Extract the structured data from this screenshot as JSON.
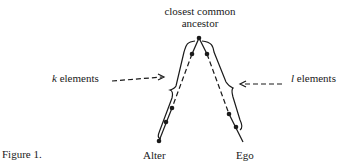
{
  "figure": {
    "caption": "Figure 1.",
    "top_label_line1": "closest common",
    "top_label_line2": "ancestor",
    "left_label_var": "k",
    "left_label_text": " elements",
    "right_label_var": "l",
    "right_label_text": " elements",
    "bottom_left": "Alter",
    "bottom_right": "Ego"
  },
  "diagram": {
    "type": "kinship-tree",
    "root": "closest common ancestor",
    "branches": [
      {
        "end": "Alter",
        "count_label": "k elements",
        "side": "left"
      },
      {
        "end": "Ego",
        "count_label": "l elements",
        "side": "right"
      }
    ]
  }
}
